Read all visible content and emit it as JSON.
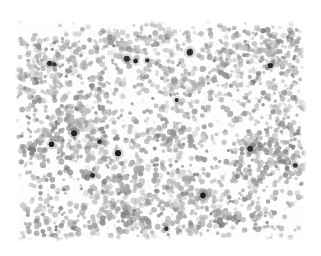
{
  "image": {
    "kind": "micrograph",
    "modality": "brightfield-light-microscopy",
    "specimen_description": "dense field of small round cells on a plain pale background",
    "width_px": 321,
    "height_px": 256,
    "background_color": "#ffffff",
    "field": {
      "left_px": 14,
      "top_px": 20,
      "width_px": 293,
      "height_px": 222,
      "fill_color": "#fdfdfd",
      "margin_color": "#ffffff"
    }
  },
  "render": {
    "seed": 20240417,
    "cell_count": 2150,
    "cell_radius_min_px": 1.5,
    "cell_radius_max_px": 3.1,
    "cell_gray_min": 118,
    "cell_gray_max": 205,
    "cell_alpha_min": 0.42,
    "cell_alpha_max": 0.9,
    "cluster_count": 46,
    "cluster_radius_px": 26,
    "cluster_cell_share": 0.46,
    "dark_spot_count": 17,
    "dark_spot_radius_min_px": 2.0,
    "dark_spot_radius_max_px": 3.6,
    "dark_spot_gray_min": 18,
    "dark_spot_gray_max": 62,
    "speckle_count": 900,
    "speckle_gray_min": 196,
    "speckle_gray_max": 232,
    "vignette_fade_px": 7,
    "edge_thin_px": 10
  },
  "palette": {
    "cell_mid_gray": "#9a9a9a",
    "cell_light_gray": "#c8c8c8",
    "dark_nucleus": "#262626",
    "paper_white": "#ffffff"
  },
  "dark_spots": [
    {
      "x": 0.6,
      "y": 0.145,
      "r": 3.2
    },
    {
      "x": 0.385,
      "y": 0.175,
      "r": 3.0
    },
    {
      "x": 0.415,
      "y": 0.185,
      "r": 2.4
    },
    {
      "x": 0.455,
      "y": 0.182,
      "r": 2.2
    },
    {
      "x": 0.122,
      "y": 0.195,
      "r": 2.6
    },
    {
      "x": 0.138,
      "y": 0.2,
      "r": 2.2
    },
    {
      "x": 0.875,
      "y": 0.205,
      "r": 2.6
    },
    {
      "x": 0.555,
      "y": 0.36,
      "r": 2.0
    },
    {
      "x": 0.205,
      "y": 0.51,
      "r": 3.0
    },
    {
      "x": 0.292,
      "y": 0.548,
      "r": 2.4
    },
    {
      "x": 0.128,
      "y": 0.56,
      "r": 2.8
    },
    {
      "x": 0.355,
      "y": 0.6,
      "r": 3.1
    },
    {
      "x": 0.806,
      "y": 0.58,
      "r": 3.0
    },
    {
      "x": 0.268,
      "y": 0.7,
      "r": 2.5
    },
    {
      "x": 0.645,
      "y": 0.79,
      "r": 2.8
    },
    {
      "x": 0.96,
      "y": 0.655,
      "r": 2.4
    },
    {
      "x": 0.52,
      "y": 0.94,
      "r": 2.2
    }
  ],
  "labels": {
    "figure_title": "",
    "scale_bar": "",
    "annotation": ""
  }
}
